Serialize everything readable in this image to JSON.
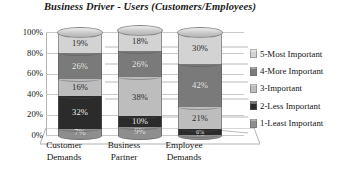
{
  "chart_data": {
    "type": "bar",
    "title": "Business Driver - Users (Customers/Employees)",
    "xlabel": "",
    "ylabel": "",
    "ylim": [
      0,
      100
    ],
    "grid": true,
    "stacked": true,
    "legend_position": "right",
    "categories": [
      "Customer Demands",
      "Business Partner",
      "Employee Demands"
    ],
    "ytick_labels": [
      "100%",
      "80%",
      "60%",
      "40%",
      "20%",
      "0%"
    ],
    "ytick_values": [
      100,
      80,
      60,
      40,
      20,
      0
    ],
    "series": [
      {
        "name": "5-Most Important",
        "values": [
          19,
          18,
          30
        ],
        "labels": [
          "19%",
          "18%",
          "30%"
        ],
        "color": "#d3d3d3"
      },
      {
        "name": "4-More Important",
        "values": [
          26,
          26,
          42
        ],
        "labels": [
          "26%",
          "26%",
          "42%"
        ],
        "color": "#7a7a7a"
      },
      {
        "name": "3-Important",
        "values": [
          16,
          38,
          21
        ],
        "labels": [
          "16%",
          "38%",
          "21%"
        ],
        "color": "#bdbdbd"
      },
      {
        "name": "2-Less Important",
        "values": [
          32,
          10,
          6
        ],
        "labels": [
          "32%",
          "10%",
          "6%"
        ],
        "color": "#2b2b2b"
      },
      {
        "name": "1-Least Important",
        "values": [
          7,
          9,
          1
        ],
        "labels": [
          "7%",
          "9%",
          "1%"
        ],
        "color": "#8e8e8e"
      }
    ]
  },
  "title": {
    "text": "Business Driver - Users (Customers/Employees)"
  },
  "yaxis": {
    "ticks": [
      {
        "label": "100%",
        "value": 100
      },
      {
        "label": "80%",
        "value": 80
      },
      {
        "label": "60%",
        "value": 60
      },
      {
        "label": "40%",
        "value": 40
      },
      {
        "label": "20%",
        "value": 20
      },
      {
        "label": "0%",
        "value": 0
      }
    ]
  },
  "xaxis": {
    "categories": [
      {
        "line1": "Customer",
        "line2": "Demands"
      },
      {
        "line1": "Business",
        "line2": "Partner"
      },
      {
        "line1": "Employee",
        "line2": "Demands"
      }
    ]
  },
  "legend": {
    "items": [
      {
        "label": "5-Most Important",
        "color": "#d3d3d3"
      },
      {
        "label": "4-More Important",
        "color": "#7a7a7a"
      },
      {
        "label": "3-Important",
        "color": "#bdbdbd"
      },
      {
        "label": "2-Less Important",
        "color": "#2b2b2b"
      },
      {
        "label": "1-Least Important",
        "color": "#8e8e8e"
      }
    ]
  },
  "bars": [
    {
      "category": "Customer Demands",
      "segments": [
        {
          "series": "1-Least Important",
          "value": 7,
          "label": "7%",
          "color": "#8e8e8e",
          "light": false
        },
        {
          "series": "2-Less Important",
          "value": 32,
          "label": "32%",
          "color": "#2b2b2b",
          "light": false
        },
        {
          "series": "3-Important",
          "value": 16,
          "label": "16%",
          "color": "#bdbdbd",
          "light": true
        },
        {
          "series": "4-More Important",
          "value": 26,
          "label": "26%",
          "color": "#7a7a7a",
          "light": false
        },
        {
          "series": "5-Most Important",
          "value": 19,
          "label": "19%",
          "color": "#d3d3d3",
          "light": true
        }
      ]
    },
    {
      "category": "Business Partner",
      "segments": [
        {
          "series": "1-Least Important",
          "value": 9,
          "label": "9%",
          "color": "#8e8e8e",
          "light": false
        },
        {
          "series": "2-Less Important",
          "value": 10,
          "label": "10%",
          "color": "#2b2b2b",
          "light": false
        },
        {
          "series": "3-Important",
          "value": 38,
          "label": "38%",
          "color": "#bdbdbd",
          "light": true
        },
        {
          "series": "4-More Important",
          "value": 26,
          "label": "26%",
          "color": "#7a7a7a",
          "light": false
        },
        {
          "series": "5-Most Important",
          "value": 18,
          "label": "18%",
          "color": "#d3d3d3",
          "light": true
        }
      ]
    },
    {
      "category": "Employee Demands",
      "segments": [
        {
          "series": "1-Least Important",
          "value": 1,
          "label": "1%",
          "color": "#8e8e8e",
          "light": false
        },
        {
          "series": "2-Less Important",
          "value": 6,
          "label": "6%",
          "color": "#2b2b2b",
          "light": false
        },
        {
          "series": "3-Important",
          "value": 21,
          "label": "21%",
          "color": "#bdbdbd",
          "light": true
        },
        {
          "series": "4-More Important",
          "value": 42,
          "label": "42%",
          "color": "#7a7a7a",
          "light": false
        },
        {
          "series": "5-Most Important",
          "value": 30,
          "label": "30%",
          "color": "#d3d3d3",
          "light": true
        }
      ]
    }
  ]
}
